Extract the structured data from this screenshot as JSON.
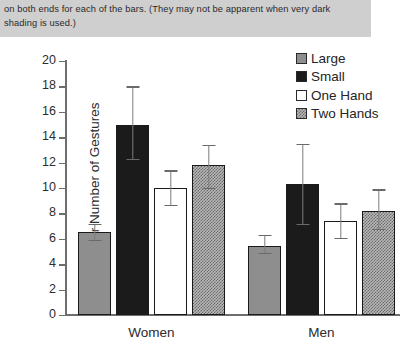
{
  "banner": {
    "text": "on both ends for each of the bars. (They may not be apparent when very dark shading is used.)"
  },
  "chart_data": {
    "type": "bar",
    "title": "",
    "xlabel": "",
    "ylabel": "Mear Number of Gestures",
    "ylim": [
      0,
      20
    ],
    "yticks": [
      0,
      2,
      4,
      6,
      8,
      10,
      12,
      14,
      16,
      18,
      20
    ],
    "ytick_labels": [
      "0",
      "2",
      "4",
      "6",
      "8",
      "10",
      "12",
      "14",
      "16",
      "18",
      "20"
    ],
    "grid": false,
    "legend_position": "top-right",
    "categories": [
      "Women",
      "Men"
    ],
    "series": [
      {
        "name": "Large",
        "swatch": "solid-gray",
        "color": "#8e8e8e",
        "values": [
          6.5,
          5.4
        ],
        "err_low": [
          5.9,
          4.9
        ],
        "err_high": [
          7.2,
          6.3
        ]
      },
      {
        "name": "Small",
        "swatch": "solid-black",
        "color": "#1b1b1b",
        "values": [
          15.0,
          10.3
        ],
        "err_low": [
          12.3,
          7.2
        ],
        "err_high": [
          18.0,
          13.5
        ]
      },
      {
        "name": "One Hand",
        "swatch": "white-outline",
        "color": "#ffffff",
        "values": [
          10.0,
          7.4
        ],
        "err_low": [
          8.7,
          6.1
        ],
        "err_high": [
          11.4,
          8.8
        ]
      },
      {
        "name": "Two Hands",
        "swatch": "checkered",
        "color": "#b9b9b9",
        "values": [
          11.8,
          8.2
        ],
        "err_low": [
          10.0,
          6.8
        ],
        "err_high": [
          13.4,
          9.9
        ]
      }
    ]
  }
}
